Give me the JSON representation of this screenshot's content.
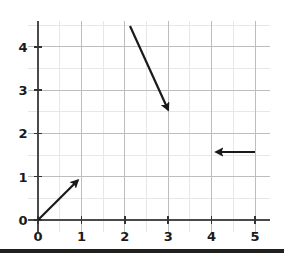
{
  "chart_data": {
    "type": "scatter",
    "title": "",
    "subtitle": "",
    "xlabel": "",
    "ylabel": "",
    "xlim": [
      -0.22,
      5.35
    ],
    "ylim": [
      -0.28,
      4.6
    ],
    "x_ticks": [
      "0",
      "1",
      "2",
      "3",
      "4",
      "5"
    ],
    "x_tick_values": [
      0,
      1,
      2,
      3,
      4,
      5
    ],
    "y_ticks": [
      "0",
      "1",
      "2",
      "3",
      "4"
    ],
    "y_tick_values": [
      0,
      1,
      2,
      3,
      4
    ],
    "grid": "on",
    "grid_major_spacing": 1,
    "grid_minor_spacing": 0.5,
    "legend": "none",
    "annotations": [
      {
        "name": "vector-arrow-1",
        "kind": "arrow",
        "tail": [
          0.0,
          0.0
        ],
        "head": [
          0.92,
          0.92
        ],
        "direction": "up-right",
        "label": ""
      },
      {
        "name": "vector-arrow-2",
        "kind": "arrow",
        "tail": [
          2.12,
          4.48
        ],
        "head": [
          3.0,
          2.54
        ],
        "direction": "down-right",
        "label": ""
      },
      {
        "name": "vector-arrow-3",
        "kind": "arrow",
        "tail": [
          5.0,
          1.57
        ],
        "head": [
          4.1,
          1.57
        ],
        "direction": "left",
        "label": ""
      }
    ],
    "series": [],
    "values": []
  },
  "axes": {
    "x_axis_name": "x-axis",
    "y_axis_name": "y-axis",
    "axis_color": "#4a4a4a",
    "grid_major_color": "#bdbdbd",
    "grid_minor_color": "#e4e4e4",
    "arrow_color": "#1a1a1a",
    "background_color": "#ffffff"
  },
  "ticks": {
    "x": [
      {
        "label": "0",
        "value": 0
      },
      {
        "label": "1",
        "value": 1
      },
      {
        "label": "2",
        "value": 2
      },
      {
        "label": "3",
        "value": 3
      },
      {
        "label": "4",
        "value": 4
      },
      {
        "label": "5",
        "value": 5
      }
    ],
    "y": [
      {
        "label": "0",
        "value": 0
      },
      {
        "label": "1",
        "value": 1
      },
      {
        "label": "2",
        "value": 2
      },
      {
        "label": "3",
        "value": 3
      },
      {
        "label": "4",
        "value": 4
      }
    ]
  }
}
